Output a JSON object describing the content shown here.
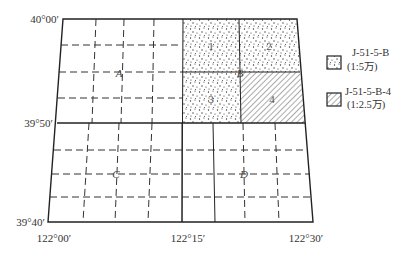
{
  "diagram": {
    "latitude_labels": {
      "top": "40°00′",
      "middle": "39°50′",
      "bottom": "39°40′"
    },
    "longitude_labels": {
      "left": "122°00′",
      "middle": "122°15′",
      "right": "122°30′"
    },
    "quadrant_labels": {
      "A": "A",
      "B": "B",
      "C": "C",
      "D": "D"
    },
    "sub_sheet_labels": [
      "1",
      "2",
      "3",
      "4"
    ],
    "legend": [
      {
        "pattern": "dotted",
        "code": "J-51-5-B",
        "scale": "(1:5万)"
      },
      {
        "pattern": "hatched",
        "code": "J-51-5-B-4",
        "scale": "(1:2.5万)"
      }
    ],
    "colors": {
      "line": "#222222",
      "dash": "#333333",
      "dots": "#333333",
      "hatch": "#444444"
    }
  }
}
